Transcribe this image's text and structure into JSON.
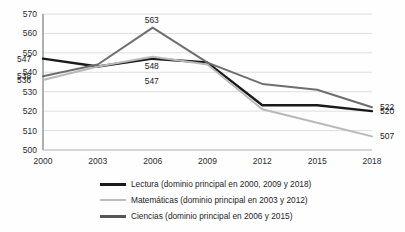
{
  "chart_data": {
    "type": "line",
    "title": "",
    "subtitle": "",
    "xlabel": "",
    "ylabel": "",
    "categories": [
      "2000",
      "2003",
      "2006",
      "2009",
      "2012",
      "2015",
      "2018"
    ],
    "ylim": [
      500,
      570
    ],
    "yticks": [
      500,
      510,
      520,
      530,
      540,
      550,
      560,
      570
    ],
    "grid": true,
    "legend_position": "bottom",
    "series": [
      {
        "name": "Lectura (dominio principal en 2000, 2009 y 2018)",
        "short_name": "Lectura",
        "color": "#1a1a1a",
        "width": 2.4,
        "values": [
          547,
          543,
          547,
          545,
          523,
          523,
          520
        ]
      },
      {
        "name": "Matemáticas (dominio principal en 2003 y 2012)",
        "short_name": "Matemáticas",
        "color": "#b9b9b9",
        "width": 2.0,
        "values": [
          536,
          543,
          548,
          544,
          521,
          514,
          507
        ]
      },
      {
        "name": "Ciencias (dominio principal en 2006 y 2015)",
        "short_name": "Ciencias",
        "color": "#6e6e6e",
        "width": 2.0,
        "values": [
          538,
          544,
          563,
          545,
          534,
          531,
          522
        ]
      }
    ],
    "point_labels": [
      {
        "series": "Lectura",
        "category": "2000",
        "value": 547,
        "text": "547"
      },
      {
        "series": "Ciencias",
        "category": "2000",
        "value": 538,
        "text": "538"
      },
      {
        "series": "Matemáticas",
        "category": "2000",
        "value": 536,
        "text": "536"
      },
      {
        "series": "Ciencias",
        "category": "2006",
        "value": 563,
        "text": "563"
      },
      {
        "series": "Matemáticas",
        "category": "2006",
        "value": 548,
        "text": "548"
      },
      {
        "series": "Lectura",
        "category": "2006",
        "value": 547,
        "text": "547"
      },
      {
        "series": "Ciencias",
        "category": "2018",
        "value": 522,
        "text": "522"
      },
      {
        "series": "Lectura",
        "category": "2018",
        "value": 520,
        "text": "520"
      },
      {
        "series": "Matemáticas",
        "category": "2018",
        "value": 507,
        "text": "507"
      }
    ]
  },
  "axis": {
    "y_tick_labels": [
      "570",
      "560",
      "550",
      "540",
      "530",
      "520",
      "510",
      "500"
    ],
    "x_tick_labels": [
      "2000",
      "2003",
      "2006",
      "2009",
      "2012",
      "2015",
      "2018"
    ]
  },
  "legend": {
    "items": [
      {
        "label": "Lectura (dominio principal en 2000, 2009 y 2018)",
        "color": "#1a1a1a",
        "thickness": "3px"
      },
      {
        "label": "Matemáticas (dominio principal en 2003 y 2012)",
        "color": "#bdbdbd",
        "thickness": "2px"
      },
      {
        "label": "Ciencias (dominio principal en 2006 y 2015)",
        "color": "#555555",
        "thickness": "3px"
      }
    ]
  },
  "colors": {
    "background": "#fefefe",
    "grid": "#d6d6d6",
    "axis": "#9a9a9a",
    "text": "#2b2b2b",
    "lectura": "#1a1a1a",
    "matematicas": "#b9b9b9",
    "ciencias": "#6e6e6e"
  }
}
